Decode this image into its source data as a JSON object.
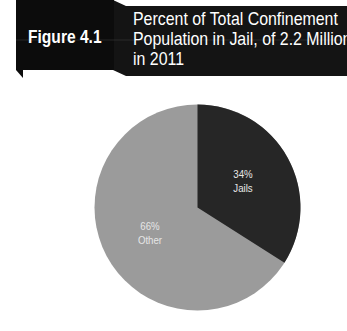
{
  "header": {
    "figure_label": "Figure 4.1",
    "title_lines": [
      "Percent of Total Confinement",
      "Population in Jail, of 2.2 Million",
      "in 2011"
    ]
  },
  "colors": {
    "header_bg": "#141414",
    "jails": "#262626",
    "other": "#9b9b9b",
    "label_text": "#e6e6e6"
  },
  "slices": [
    {
      "name": "Jails",
      "percent_label": "34%",
      "label": "Jails"
    },
    {
      "name": "Other",
      "percent_label": "66%",
      "label": "Other"
    }
  ],
  "chart_data": {
    "type": "pie",
    "title": "Percent of Total Confinement Population in Jail, of 2.2 Million in 2011",
    "figure": "Figure 4.1",
    "categories": [
      "Jails",
      "Other"
    ],
    "values": [
      34,
      66
    ],
    "unit": "%",
    "total_population": "2.2 Million",
    "year": 2011,
    "legend": "none (direct labels on slices)",
    "start_angle": "12 o'clock, clockwise (Jails first)"
  }
}
